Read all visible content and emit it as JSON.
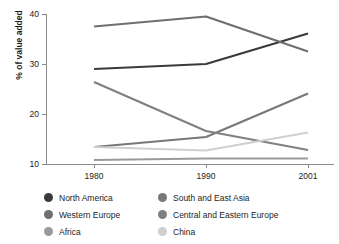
{
  "chart_data": {
    "type": "line",
    "title": "",
    "xlabel": "",
    "ylabel": "% of value added",
    "categories": [
      "1980",
      "1990",
      "2001"
    ],
    "x_tick_labels": [
      "1980",
      "1990",
      "2001"
    ],
    "y_tick_labels": [
      "10",
      "20",
      "30",
      "40"
    ],
    "y_ticks": [
      10,
      20,
      30,
      40
    ],
    "ylim": [
      10,
      40
    ],
    "grid": false,
    "legend_position": "bottom",
    "legend_columns": 2,
    "series": [
      {
        "name": "North America",
        "color": "#3a3a3a",
        "values": [
          29.0,
          30.0,
          36.1
        ]
      },
      {
        "name": "Western Europe",
        "color": "#6f6f6f",
        "values": [
          37.5,
          39.5,
          32.5
        ]
      },
      {
        "name": "Africa",
        "color": "#9a9a9a",
        "values": [
          10.8,
          11.1,
          11.1
        ]
      },
      {
        "name": "South and East Asia",
        "color": "#787878",
        "values": [
          13.4,
          15.4,
          24.1
        ]
      },
      {
        "name": "Central and Eastern Europe",
        "color": "#808080",
        "values": [
          26.4,
          16.6,
          12.8
        ]
      },
      {
        "name": "China",
        "color": "#cfcfcf",
        "values": [
          13.4,
          12.7,
          16.3
        ]
      }
    ]
  },
  "axis": {
    "ylabel": "% of value added"
  },
  "legend": {
    "items": [
      {
        "label": "North America",
        "color": "#3a3a3a"
      },
      {
        "label": "South and East Asia",
        "color": "#787878"
      },
      {
        "label": "Western Europe",
        "color": "#6f6f6f"
      },
      {
        "label": "Central and Eastern Europe",
        "color": "#808080"
      },
      {
        "label": "Africa",
        "color": "#9a9a9a"
      },
      {
        "label": "China",
        "color": "#cfcfcf"
      }
    ]
  }
}
